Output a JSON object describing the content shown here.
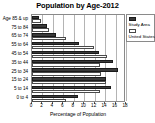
{
  "chart_data": {
    "type": "bar",
    "title": "Population by Age-2012",
    "orientation": "horizontal",
    "xlabel": "Percentage of Population",
    "ylabel": "",
    "xlim": [
      0,
      18
    ],
    "xticks": [
      0,
      2,
      4,
      6,
      8,
      10,
      12,
      14,
      16,
      18
    ],
    "grid": true,
    "legend_position": "right",
    "categories": [
      "Age 85 & up",
      "75 to 84",
      "65 to 74",
      "55 to 64",
      "45 to 54",
      "35 to 44",
      "25 to 34",
      "15 to 24",
      "5 to 14",
      "0 to 4"
    ],
    "series": [
      {
        "name": "Study Area",
        "color": "#3a3a3a",
        "values": [
          1.3,
          2.8,
          4.6,
          9.0,
          12.8,
          15.5,
          16.5,
          14.2,
          15.2,
          8.8
        ]
      },
      {
        "name": "United States",
        "color": "#ffffff",
        "values": [
          1.8,
          3.2,
          6.5,
          11.8,
          14.3,
          13.0,
          13.3,
          14.2,
          13.0,
          6.5
        ]
      }
    ]
  },
  "legend": {
    "entries": [
      {
        "label": "Study Area"
      },
      {
        "label": "United States"
      }
    ]
  }
}
